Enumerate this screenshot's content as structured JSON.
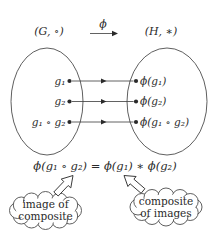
{
  "map": {
    "label": "ϕ"
  },
  "domain": {
    "label": "(G, ∘)",
    "elements": [
      "g₁",
      "g₂",
      "g₁ ∘ g₂"
    ]
  },
  "codomain": {
    "label": "(H, ∗)",
    "elements": [
      "ϕ(g₁)",
      "ϕ(g₂)",
      "ϕ(g₁ ∘ g₂)"
    ]
  },
  "equation": "ϕ(g₁ ∘ g₂) = ϕ(g₁) ∗ ϕ(g₂)",
  "callouts": {
    "left": {
      "lines": [
        "image of",
        "composite"
      ]
    },
    "right": {
      "lines": [
        "composite",
        "of images"
      ]
    }
  },
  "colors": {
    "ink": "#2a2a2a",
    "outline": "#4d4d4d",
    "background": "#ffffff"
  }
}
